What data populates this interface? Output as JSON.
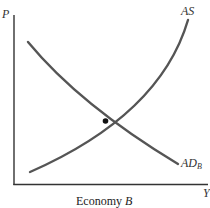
{
  "diagram": {
    "type": "aggregate supply / aggregate demand graph",
    "y_axis_label": "P",
    "x_axis_label": "Y",
    "curves": [
      {
        "name": "AS",
        "label": "AS",
        "shape": "upward-sloping, convex (steepening)"
      },
      {
        "name": "AD",
        "label_main": "AD",
        "label_sub": "B",
        "shape": "downward-sloping, convex"
      }
    ],
    "equilibrium_point": "intersection of AS and AD_B",
    "caption": {
      "prefix": "Economy ",
      "italic": "B"
    }
  },
  "colors": {
    "axis": "#333333",
    "curve": "#555555",
    "point": "#111111",
    "text": "#333333"
  }
}
